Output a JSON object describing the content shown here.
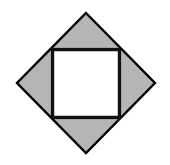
{
  "canvas": {
    "width": 170,
    "height": 165,
    "background_color": "#ffffff",
    "description": "Geometric figure: a gray diamond (square rotated 45 degrees) with a white axis-aligned square inscribed inside it, leaving four gray triangles."
  },
  "style": {
    "diamond_fill": "#b5b5b5",
    "diamond_stroke": "#000000",
    "diamond_stroke_width": 2.4,
    "inner_square_fill": "#ffffff",
    "inner_square_stroke": "#111111",
    "inner_square_stroke_width": 2.2
  },
  "shapes": {
    "diamond": {
      "name": "outer-diamond",
      "type": "polygon",
      "points": "86,13 155,83 86,153 17,83",
      "vertices": {
        "top": [
          86,
          13
        ],
        "right": [
          155,
          83
        ],
        "bottom": [
          86,
          153
        ],
        "left": [
          17,
          83
        ]
      },
      "fill": "#b5b5b5",
      "stroke": "#000000"
    },
    "inner_square": {
      "name": "inner-square",
      "type": "rect",
      "x": 52,
      "y": 49,
      "width": 68,
      "height": 69,
      "corners": {
        "top_left": [
          52,
          49
        ],
        "top_right": [
          120,
          49
        ],
        "bottom_right": [
          120,
          118
        ],
        "bottom_left": [
          52,
          118
        ]
      },
      "fill": "#ffffff",
      "stroke": "#111111"
    },
    "gray_regions": [
      {
        "name": "top-triangle",
        "points": "52,49 120,49 86,13"
      },
      {
        "name": "right-triangle",
        "points": "120,49 155,83 120,118"
      },
      {
        "name": "bottom-triangle",
        "points": "120,118 86,153 52,118"
      },
      {
        "name": "left-triangle",
        "points": "52,118 17,83 52,49"
      }
    ]
  },
  "labels": {
    "title": "",
    "annotations": []
  }
}
